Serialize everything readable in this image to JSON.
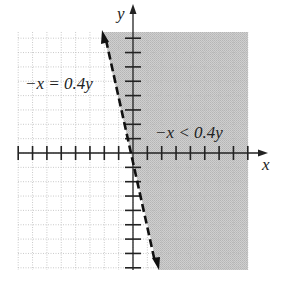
{
  "chart_data": {
    "type": "inequality-graph",
    "title": "",
    "xlabel": "x",
    "ylabel": "y",
    "xlim": [
      -8,
      8
    ],
    "ylim": [
      -8,
      8.5
    ],
    "grid": true,
    "tick_spacing": 1,
    "boundary": {
      "equation": "-x = 0.4y",
      "style": "dashed",
      "passes_through": [
        0,
        0
      ],
      "endpoints_screen_units": [
        [
          -2.1,
          8.4
        ],
        [
          1.7,
          -8.1
        ]
      ]
    },
    "inequality": {
      "expression": "-x < 0.4y",
      "shaded_region": "right of boundary line"
    },
    "annotations": [
      {
        "text": "−x = 0.4y",
        "position": [
          -7.5,
          5
        ]
      },
      {
        "text": "−x < 0.4y",
        "position": [
          1.5,
          1.5
        ]
      }
    ],
    "colors": {
      "shade": "#c4c4c4",
      "grid": "#bdbdbd",
      "axis": "#222222",
      "line": "#111111"
    }
  },
  "labels": {
    "x_axis": "x",
    "y_axis": "y",
    "boundary_label": "−x = 0.4y",
    "region_label": "−x < 0.4y"
  }
}
